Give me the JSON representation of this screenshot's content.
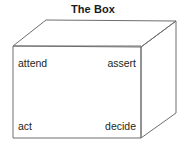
{
  "figure": {
    "title": "The Box",
    "shape": "cuboid-wireframe",
    "background_color": "#ffffff",
    "edge_color": "#6e6e6e",
    "text_color": "#231f20"
  },
  "labels": {
    "top_left": "attend",
    "top_right": "assert",
    "bottom_left": "act",
    "bottom_right": "decide"
  },
  "geometry": {
    "front_face": {
      "top_left": [
        13,
        46
      ],
      "top_right": [
        141,
        47
      ],
      "bottom_right": [
        141,
        138
      ],
      "bottom_left": [
        13,
        138
      ]
    },
    "top_face": {
      "front_left": [
        13,
        46
      ],
      "back_left": [
        46,
        20
      ],
      "back_right": [
        176,
        21
      ],
      "front_right": [
        141,
        47
      ]
    },
    "right_face": {
      "front_top": [
        141,
        47
      ],
      "back_top": [
        176,
        21
      ],
      "back_bottom": [
        176,
        113
      ],
      "front_bottom": [
        141,
        138
      ]
    }
  }
}
